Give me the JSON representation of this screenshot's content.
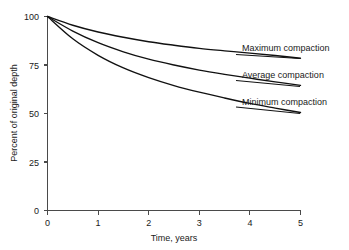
{
  "chart_data": {
    "type": "line",
    "title": "",
    "xlabel": "Time, years",
    "ylabel": "Percent of original depth",
    "xlim": [
      0,
      5
    ],
    "ylim": [
      0,
      100
    ],
    "xticks": [
      "0",
      "1",
      "2",
      "3",
      "4",
      "5"
    ],
    "yticks": [
      "0",
      "25",
      "50",
      "75",
      "100"
    ],
    "grid": false,
    "legend_position": "inline-right-of-curve-ends",
    "x": [
      0,
      0.5,
      1,
      1.5,
      2,
      2.5,
      3,
      3.5,
      4,
      4.5,
      5
    ],
    "series": [
      {
        "name": "Maximum compaction",
        "label": "Maximum compaction",
        "color": "#111111",
        "values": [
          100,
          95.5,
          92.0,
          89.3,
          87.0,
          85.2,
          83.6,
          82.3,
          81.1,
          79.9,
          78.5
        ]
      },
      {
        "name": "Average compaction",
        "label": "Average compaction",
        "color": "#111111",
        "values": [
          100,
          92.5,
          86.5,
          81.8,
          78.0,
          75.0,
          72.4,
          70.2,
          68.2,
          66.3,
          64.5
        ]
      },
      {
        "name": "Minimum compaction",
        "label": "Minimum compaction",
        "color": "#111111",
        "values": [
          100,
          88.5,
          80.0,
          73.5,
          68.5,
          64.4,
          61.0,
          58.0,
          55.2,
          52.8,
          50.5
        ]
      }
    ],
    "annotations": [
      {
        "text": "Maximum compaction",
        "series": "Maximum compaction"
      },
      {
        "text": "Average compaction",
        "series": "Average compaction"
      },
      {
        "text": "Minimum compaction",
        "series": "Minimum compaction"
      }
    ]
  },
  "axes": {
    "y_title": "Percent of original depth",
    "x_title": "Time, years",
    "y_tick_labels": [
      "100",
      "75",
      "50",
      "25",
      "0"
    ],
    "x_tick_labels": [
      "0",
      "1",
      "2",
      "3",
      "4",
      "5"
    ]
  },
  "labels": {
    "maximum": "Maximum compaction",
    "average": "Average compaction",
    "minimum": "Minimum compaction"
  },
  "colors": {
    "curve": "#111111",
    "axis": "#4a4a4a",
    "background": "#ffffff",
    "text": "#1a1a1a"
  }
}
